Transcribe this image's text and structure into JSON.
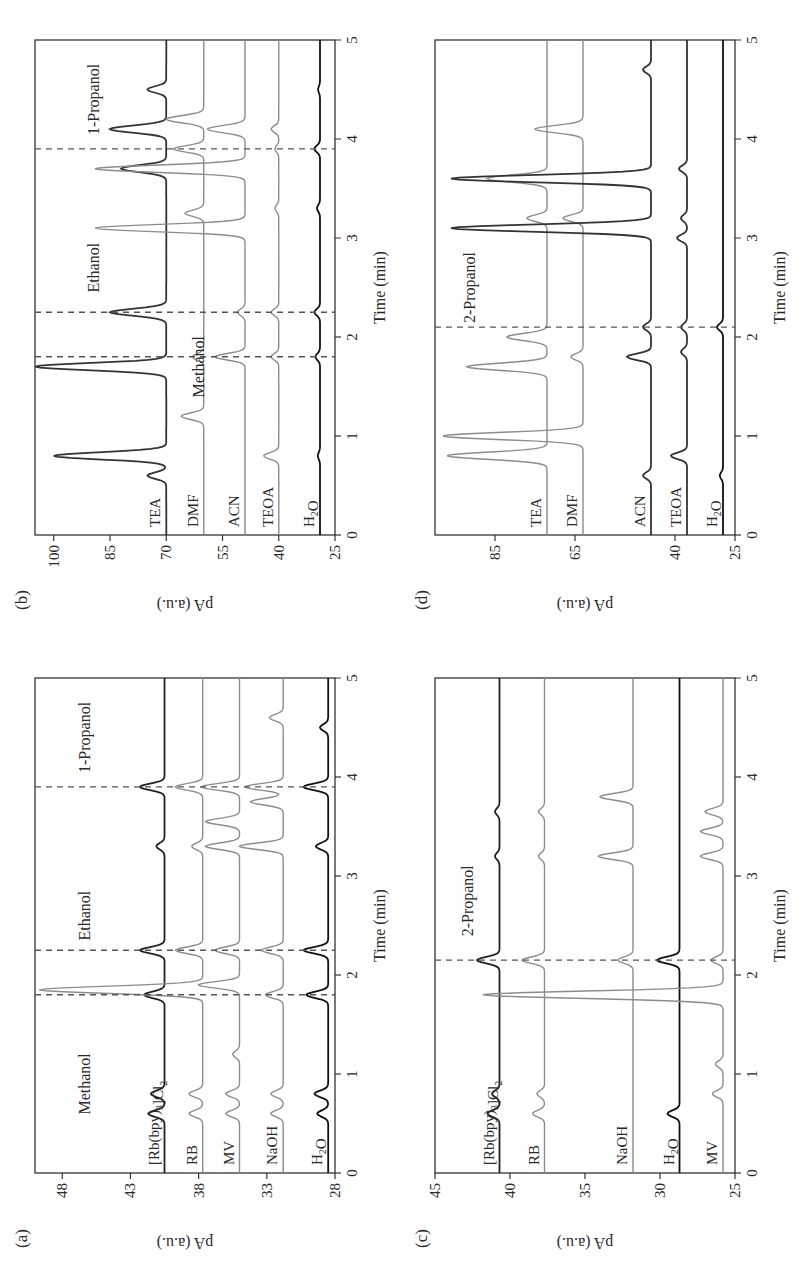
{
  "figure": {
    "panels": [
      {
        "id": "a",
        "label": "(a)",
        "ylabel": "pA (a.u.)",
        "xlabel": "Time (min)",
        "xticks": [
          "0",
          "1",
          "2",
          "3",
          "4",
          "5"
        ],
        "yticks": [
          "28",
          "33",
          "38",
          "43",
          "48"
        ],
        "annotations": [
          "Methanol",
          "Ethanol",
          "1-Propanol"
        ],
        "series_labels": [
          "[Rb(bpy)3]Cl2",
          "RB",
          "MV",
          "NaOH",
          "H2O"
        ]
      },
      {
        "id": "b",
        "label": "(b)",
        "ylabel": "pA (a.u.)",
        "xlabel": "Time (min)",
        "xticks": [
          "0",
          "1",
          "2",
          "3",
          "4",
          "5"
        ],
        "yticks": [
          "25",
          "40",
          "55",
          "70",
          "85",
          "100"
        ],
        "annotations": [
          "Methanol",
          "Ethanol",
          "1-Propanol"
        ],
        "series_labels": [
          "TEA",
          "DMF",
          "ACN",
          "TEOA",
          "H2O"
        ]
      },
      {
        "id": "c",
        "label": "(c)",
        "ylabel": "pA (a.u.)",
        "xlabel": "Time (min)",
        "xticks": [
          "0",
          "1",
          "2",
          "3",
          "4",
          "5"
        ],
        "yticks": [
          "25",
          "30",
          "35",
          "40",
          "45"
        ],
        "annotations": [
          "2-Propanol"
        ],
        "series_labels": [
          "[Rb(bpy)3]Cl2",
          "RB",
          "NaOH",
          "H2O",
          "MV"
        ]
      },
      {
        "id": "d",
        "label": "(d)",
        "ylabel": "pA (a.u.)",
        "xlabel": "Time (min)",
        "xticks": [
          "0",
          "1",
          "2",
          "3",
          "4",
          "5"
        ],
        "yticks": [
          "25",
          "40",
          "65",
          "85"
        ],
        "annotations": [
          "2-Propanol"
        ],
        "series_labels": [
          "TEA",
          "DMF",
          "ACN",
          "TEOA",
          "H2O"
        ]
      }
    ]
  },
  "chart_data": [
    {
      "panel": "a",
      "type": "line",
      "title": "",
      "xlabel": "Time (min)",
      "ylabel": "pA (a.u.)",
      "xlim": [
        0,
        5
      ],
      "ylim": [
        28,
        50
      ],
      "yticks": [
        28,
        33,
        38,
        43,
        48
      ],
      "grid": false,
      "reference_lines_x": [
        1.8,
        2.25,
        3.9
      ],
      "annotations": [
        {
          "text": "Methanol",
          "x": 0.9,
          "y": 46
        },
        {
          "text": "Ethanol",
          "x": 2.6,
          "y": 46
        },
        {
          "text": "1-Propanol",
          "x": 4.4,
          "y": 46
        }
      ],
      "series": [
        {
          "name": "[Rb(bpy)3]Cl2",
          "color": "#222222",
          "baseline": 40.5,
          "peaks": [
            {
              "x": 0.6,
              "h": 1.2
            },
            {
              "x": 0.8,
              "h": 1.0
            },
            {
              "x": 1.8,
              "h": 1.5
            },
            {
              "x": 2.25,
              "h": 1.8
            },
            {
              "x": 3.3,
              "h": 0.6
            },
            {
              "x": 3.9,
              "h": 1.8
            }
          ]
        },
        {
          "name": "RB",
          "color": "#8c8c8c",
          "baseline": 37.7,
          "peaks": [
            {
              "x": 0.6,
              "h": 1.0
            },
            {
              "x": 0.8,
              "h": 1.0
            },
            {
              "x": 1.85,
              "h": 12
            },
            {
              "x": 2.25,
              "h": 2.0
            },
            {
              "x": 3.3,
              "h": 0.8
            },
            {
              "x": 3.9,
              "h": 2.0
            }
          ]
        },
        {
          "name": "MV",
          "color": "#8c8c8c",
          "baseline": 35.0,
          "peaks": [
            {
              "x": 0.6,
              "h": 1.0
            },
            {
              "x": 0.8,
              "h": 1.0
            },
            {
              "x": 1.2,
              "h": 0.5
            },
            {
              "x": 1.9,
              "h": 3.0
            },
            {
              "x": 2.25,
              "h": 1.8
            },
            {
              "x": 3.3,
              "h": 2.5
            },
            {
              "x": 3.55,
              "h": 2.5
            },
            {
              "x": 3.9,
              "h": 2.8
            }
          ]
        },
        {
          "name": "NaOH",
          "color": "#8c8c8c",
          "baseline": 31.8,
          "peaks": [
            {
              "x": 0.6,
              "h": 0.9
            },
            {
              "x": 0.8,
              "h": 0.9
            },
            {
              "x": 1.8,
              "h": 1.3
            },
            {
              "x": 2.25,
              "h": 1.6
            },
            {
              "x": 3.3,
              "h": 3.2
            },
            {
              "x": 3.75,
              "h": 2.4
            },
            {
              "x": 3.9,
              "h": 2.8
            },
            {
              "x": 4.6,
              "h": 1.0
            }
          ]
        },
        {
          "name": "H2O",
          "color": "#111111",
          "baseline": 28.5,
          "peaks": [
            {
              "x": 0.6,
              "h": 0.8
            },
            {
              "x": 0.8,
              "h": 1.0
            },
            {
              "x": 1.8,
              "h": 1.6
            },
            {
              "x": 2.25,
              "h": 1.8
            },
            {
              "x": 3.3,
              "h": 0.9
            },
            {
              "x": 3.9,
              "h": 1.8
            },
            {
              "x": 4.5,
              "h": 0.6
            }
          ]
        }
      ]
    },
    {
      "panel": "b",
      "type": "line",
      "title": "",
      "xlabel": "Time (min)",
      "ylabel": "pA (a.u.)",
      "xlim": [
        0,
        5
      ],
      "ylim": [
        25,
        105
      ],
      "yticks": [
        25,
        40,
        55,
        70,
        85,
        100
      ],
      "grid": false,
      "reference_lines_x": [
        1.8,
        2.25,
        3.9
      ],
      "annotations": [
        {
          "text": "Methanol",
          "x": 1.7,
          "y": 60
        },
        {
          "text": "Ethanol",
          "x": 2.7,
          "y": 88
        },
        {
          "text": "1-Propanol",
          "x": 4.4,
          "y": 88
        }
      ],
      "series": [
        {
          "name": "TEA",
          "color": "#333333",
          "baseline": 70,
          "peaks": [
            {
              "x": 0.6,
              "h": 5
            },
            {
              "x": 0.8,
              "h": 30
            },
            {
              "x": 1.7,
              "h": 35
            },
            {
              "x": 2.25,
              "h": 15
            },
            {
              "x": 3.7,
              "h": 12
            },
            {
              "x": 4.1,
              "h": 15
            },
            {
              "x": 4.5,
              "h": 5
            }
          ]
        },
        {
          "name": "DMF",
          "color": "#8c8c8c",
          "baseline": 60,
          "peaks": [
            {
              "x": 1.2,
              "h": 6
            },
            {
              "x": 1.8,
              "h": 3
            },
            {
              "x": 3.25,
              "h": 5
            },
            {
              "x": 3.9,
              "h": 8
            },
            {
              "x": 4.2,
              "h": 10
            }
          ]
        },
        {
          "name": "ACN",
          "color": "#8c8c8c",
          "baseline": 49,
          "peaks": [
            {
              "x": 1.8,
              "h": 8
            },
            {
              "x": 2.25,
              "h": 2
            },
            {
              "x": 3.1,
              "h": 40
            },
            {
              "x": 3.7,
              "h": 40
            },
            {
              "x": 4.1,
              "h": 10
            }
          ]
        },
        {
          "name": "TEOA",
          "color": "#8c8c8c",
          "baseline": 40,
          "peaks": [
            {
              "x": 0.8,
              "h": 4
            },
            {
              "x": 1.8,
              "h": 2
            },
            {
              "x": 2.25,
              "h": 2
            },
            {
              "x": 3.3,
              "h": 1
            },
            {
              "x": 3.9,
              "h": 1
            },
            {
              "x": 4.1,
              "h": 2
            }
          ]
        },
        {
          "name": "H2O",
          "color": "#111111",
          "baseline": 29,
          "peaks": [
            {
              "x": 0.8,
              "h": 0.6
            },
            {
              "x": 1.8,
              "h": 1.2
            },
            {
              "x": 2.25,
              "h": 1.5
            },
            {
              "x": 3.3,
              "h": 0.8
            },
            {
              "x": 3.9,
              "h": 1.5
            },
            {
              "x": 4.5,
              "h": 0.5
            }
          ]
        }
      ]
    },
    {
      "panel": "c",
      "type": "line",
      "title": "",
      "xlabel": "Time (min)",
      "ylabel": "pA (a.u.)",
      "xlim": [
        0,
        5
      ],
      "ylim": [
        25,
        45
      ],
      "yticks": [
        25,
        30,
        35,
        40,
        45
      ],
      "grid": false,
      "reference_lines_x": [
        2.15
      ],
      "annotations": [
        {
          "text": "2-Propanol",
          "x": 2.75,
          "y": 42.5
        }
      ],
      "series": [
        {
          "name": "[Rb(bpy)3]Cl2",
          "color": "#222222",
          "baseline": 40.7,
          "peaks": [
            {
              "x": 0.6,
              "h": 0.8
            },
            {
              "x": 0.8,
              "h": 0.5
            },
            {
              "x": 2.15,
              "h": 1.5
            },
            {
              "x": 3.2,
              "h": 0.3
            },
            {
              "x": 3.65,
              "h": 0.3
            }
          ]
        },
        {
          "name": "RB",
          "color": "#8c8c8c",
          "baseline": 37.7,
          "peaks": [
            {
              "x": 0.6,
              "h": 0.8
            },
            {
              "x": 0.8,
              "h": 0.5
            },
            {
              "x": 2.15,
              "h": 1.5
            },
            {
              "x": 3.2,
              "h": 0.4
            },
            {
              "x": 3.65,
              "h": 0.4
            }
          ]
        },
        {
          "name": "NaOH",
          "color": "#8c8c8c",
          "baseline": 31.8,
          "peaks": [
            {
              "x": 2.15,
              "h": 1.0
            },
            {
              "x": 3.2,
              "h": 2.3
            },
            {
              "x": 3.8,
              "h": 2.2
            }
          ]
        },
        {
          "name": "H2O",
          "color": "#111111",
          "baseline": 28.7,
          "peaks": [
            {
              "x": 0.6,
              "h": 0.8
            },
            {
              "x": 2.15,
              "h": 1.5
            }
          ]
        },
        {
          "name": "MV",
          "color": "#8c8c8c",
          "baseline": 25.8,
          "peaks": [
            {
              "x": 0.8,
              "h": 0.7
            },
            {
              "x": 1.1,
              "h": 0.5
            },
            {
              "x": 1.8,
              "h": 16
            },
            {
              "x": 2.15,
              "h": 0.8
            },
            {
              "x": 3.2,
              "h": 1.5
            },
            {
              "x": 3.45,
              "h": 1.5
            },
            {
              "x": 3.65,
              "h": 1.2
            }
          ]
        }
      ]
    },
    {
      "panel": "d",
      "type": "line",
      "title": "",
      "xlabel": "Time (min)",
      "ylabel": "pA (a.u.)",
      "xlim": [
        0,
        5
      ],
      "ylim": [
        25,
        100
      ],
      "yticks": [
        25,
        40,
        65,
        85
      ],
      "grid": false,
      "reference_lines_x": [
        2.1
      ],
      "annotations": [
        {
          "text": "2-Propanol",
          "x": 2.5,
          "y": 90
        }
      ],
      "series": [
        {
          "name": "TEA",
          "color": "#8c8c8c",
          "baseline": 72,
          "peaks": [
            {
              "x": 0.8,
              "h": 25
            },
            {
              "x": 1.7,
              "h": 20
            },
            {
              "x": 2.0,
              "h": 10
            },
            {
              "x": 3.2,
              "h": 5
            },
            {
              "x": 3.6,
              "h": 15
            }
          ]
        },
        {
          "name": "DMF",
          "color": "#8c8c8c",
          "baseline": 63,
          "peaks": [
            {
              "x": 1.0,
              "h": 35
            },
            {
              "x": 1.8,
              "h": 3
            },
            {
              "x": 3.2,
              "h": 5
            },
            {
              "x": 4.1,
              "h": 12
            }
          ]
        },
        {
          "name": "ACN",
          "color": "#333333",
          "baseline": 46,
          "peaks": [
            {
              "x": 0.6,
              "h": 2
            },
            {
              "x": 1.8,
              "h": 6
            },
            {
              "x": 2.1,
              "h": 2
            },
            {
              "x": 3.1,
              "h": 50
            },
            {
              "x": 3.6,
              "h": 50
            },
            {
              "x": 4.7,
              "h": 2
            }
          ]
        },
        {
          "name": "TEOA",
          "color": "#333333",
          "baseline": 37,
          "peaks": [
            {
              "x": 0.8,
              "h": 4
            },
            {
              "x": 1.85,
              "h": 1.5
            },
            {
              "x": 2.1,
              "h": 1.5
            },
            {
              "x": 3.0,
              "h": 2.5
            },
            {
              "x": 3.2,
              "h": 1.5
            },
            {
              "x": 3.7,
              "h": 2
            }
          ]
        },
        {
          "name": "H2O",
          "color": "#111111",
          "baseline": 28,
          "peaks": [
            {
              "x": 0.6,
              "h": 0.8
            },
            {
              "x": 2.1,
              "h": 1.5
            }
          ]
        }
      ]
    }
  ]
}
